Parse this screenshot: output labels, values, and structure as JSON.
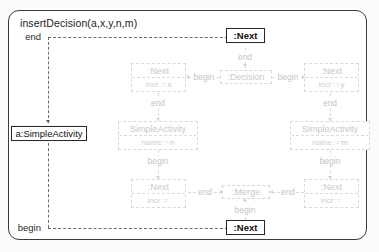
{
  "diagram": {
    "title": "insertDecision(a,x,y,n,m)",
    "nodes": {
      "top_next": {
        "label": ":Next"
      },
      "bottom_next": {
        "label": ":Next"
      },
      "anchor_activity": {
        "label": "a:SimpleActivity"
      },
      "next_x": {
        "label": ":Next",
        "attr": "incr",
        "op": ":=",
        "value": "x"
      },
      "next_y": {
        "label": ":Next",
        "attr": "incr",
        "op": ":=",
        "value": "y"
      },
      "decision": {
        "label": ":Decision"
      },
      "merge": {
        "label": ":Merge"
      },
      "activity_n": {
        "label": "SimpleActivity",
        "attr": "name",
        "op": ":=",
        "value": "n"
      },
      "activity_m": {
        "label": "SimpleActivity",
        "attr": "name",
        "op": ":=",
        "value": "m"
      },
      "next_bl": {
        "label": ":Next",
        "attr": "incr",
        "op": ":=",
        "value": ""
      },
      "next_br": {
        "label": ":Next",
        "attr": "incr",
        "op": ":=",
        "value": ""
      }
    },
    "edges": {
      "top_end": "end",
      "bottom_begin": "begin",
      "decision_end": "end",
      "decision_begin_l": "begin",
      "decision_begin_r": "begin",
      "next_x_end": "end",
      "next_y_end": "end",
      "activity_n_begin": "begin",
      "activity_m_begin": "begin",
      "merge_end_l": "end",
      "merge_end_r": "end",
      "merge_begin": "begin"
    },
    "colors": {
      "frame": "#3b3b3b",
      "solid": "#2a2a2a",
      "ghost": "#d9d9d9",
      "label": "#c4c4c4",
      "canvas": "#ffffff"
    }
  }
}
